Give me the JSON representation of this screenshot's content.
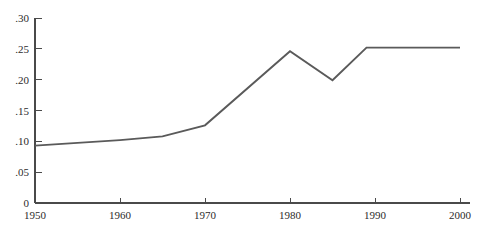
{
  "chart_data": {
    "type": "line",
    "title": "",
    "subtitle": "",
    "xlabel": "",
    "ylabel": "",
    "x": [
      1950,
      1960,
      1965,
      1970,
      1980,
      1985,
      1989,
      2000
    ],
    "values": [
      0.093,
      0.102,
      0.108,
      0.126,
      0.246,
      0.199,
      0.252,
      0.252
    ],
    "series": [
      {
        "name": "",
        "values": [
          0.093,
          0.102,
          0.108,
          0.126,
          0.246,
          0.199,
          0.252,
          0.252
        ]
      }
    ],
    "xlim": [
      1950,
      2000
    ],
    "ylim": [
      0,
      0.3
    ],
    "grid": false,
    "legend": null,
    "legend_position": "none",
    "line_color": "#5a5a5a",
    "axis_color": "#4a4a4a",
    "background_color": "#ffffff",
    "y_ticks": [
      {
        "value": 0.3,
        "label": ".30"
      },
      {
        "value": 0.25,
        "label": ".25"
      },
      {
        "value": 0.2,
        "label": ".20"
      },
      {
        "value": 0.15,
        "label": ".15"
      },
      {
        "value": 0.1,
        "label": ".10"
      },
      {
        "value": 0.05,
        "label": ".05"
      },
      {
        "value": 0.0,
        "label": "0"
      }
    ],
    "x_ticks": [
      {
        "value": 1950,
        "label": "1950"
      },
      {
        "value": 1960,
        "label": "1960"
      },
      {
        "value": 1970,
        "label": "1970"
      },
      {
        "value": 1980,
        "label": "1980"
      },
      {
        "value": 1990,
        "label": "1990"
      },
      {
        "value": 2000,
        "label": "2000"
      }
    ]
  }
}
